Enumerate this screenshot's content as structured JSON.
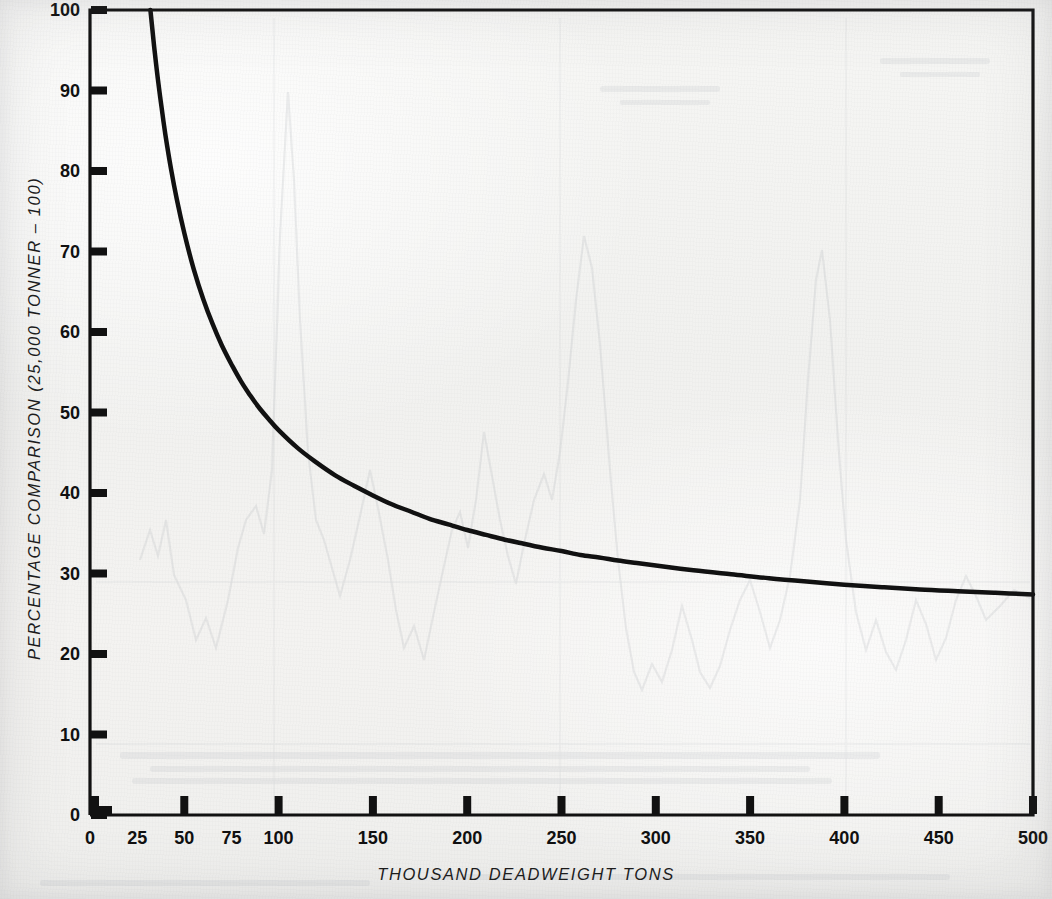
{
  "chart_data": {
    "type": "line",
    "title": "",
    "xlabel": "THOUSAND DEADWEIGHT TONS",
    "ylabel": "PERCENTAGE COMPARISON  (25,000 TONNER – 100)",
    "xlim": [
      0,
      500
    ],
    "ylim": [
      0,
      100
    ],
    "grid": false,
    "legend": null,
    "x_tick_labels": [
      "0",
      "25",
      "50",
      "75",
      "100",
      "150",
      "200",
      "250",
      "300",
      "350",
      "400",
      "450",
      "500"
    ],
    "x_tick_values": [
      0,
      25,
      50,
      75,
      100,
      150,
      200,
      250,
      300,
      350,
      400,
      450,
      500
    ],
    "x_major_tick_values": [
      50,
      100,
      150,
      200,
      250,
      300,
      350,
      400,
      450,
      500
    ],
    "y_tick_labels": [
      "0",
      "10",
      "20",
      "30",
      "40",
      "50",
      "60",
      "70",
      "80",
      "90",
      "100"
    ],
    "y_tick_values": [
      0,
      10,
      20,
      30,
      40,
      50,
      60,
      70,
      80,
      90,
      100
    ],
    "series": [
      {
        "name": "Percentage comparison",
        "x": [
          32,
          34,
          36,
          38,
          40,
          43,
          46,
          50,
          55,
          60,
          65,
          70,
          75,
          80,
          85,
          90,
          95,
          100,
          110,
          120,
          130,
          140,
          150,
          160,
          170,
          180,
          190,
          200,
          210,
          220,
          230,
          240,
          250,
          260,
          270,
          280,
          290,
          300,
          320,
          340,
          360,
          380,
          400,
          420,
          440,
          460,
          480,
          500
        ],
        "y": [
          100,
          95.5,
          91.4,
          87.8,
          84.5,
          80.2,
          76.5,
          72.3,
          67.8,
          64.1,
          61.0,
          58.3,
          56.0,
          53.9,
          52.1,
          50.5,
          49.1,
          47.8,
          45.6,
          43.8,
          42.2,
          40.9,
          39.7,
          38.6,
          37.7,
          36.8,
          36.1,
          35.4,
          34.8,
          34.2,
          33.7,
          33.2,
          32.8,
          32.3,
          32.0,
          31.6,
          31.3,
          31.0,
          30.4,
          29.9,
          29.4,
          29.0,
          28.6,
          28.3,
          28.0,
          27.8,
          27.6,
          27.4
        ]
      }
    ],
    "curve_notes": "Hyperbolic decay; enters plot at top-left near x=32 at y=100 and flattens toward an asymptote of about 25 at x=500",
    "asymptote": 25,
    "line_color": "#111111",
    "line_width": 4.5
  },
  "axes": {
    "frame_color": "#111111",
    "background_color": "#f2f2f0",
    "x_axis_name": "x-axis",
    "y_axis_name": "y-axis"
  }
}
